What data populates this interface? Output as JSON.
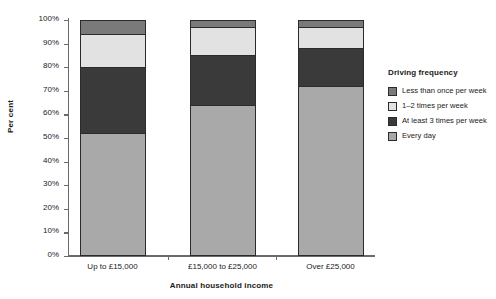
{
  "chart_data": {
    "type": "bar",
    "stacked": true,
    "title": "",
    "xlabel": "Annual household income",
    "ylabel": "Per cent",
    "categories": [
      "Up to £15,000",
      "£15,000 to £25,000",
      "Over £25,000"
    ],
    "ylim": [
      0,
      100
    ],
    "ytick_labels": [
      "0%",
      "10%",
      "20%",
      "30%",
      "40%",
      "50%",
      "60%",
      "70%",
      "80%",
      "90%",
      "100%"
    ],
    "ytick_values": [
      0,
      10,
      20,
      30,
      40,
      50,
      60,
      70,
      80,
      90,
      100
    ],
    "grid": false,
    "legend_position": "right",
    "legend_title": "Driving frequency",
    "series": [
      {
        "name": "Every day",
        "color": "#a9a9a9",
        "values": [
          52,
          64,
          72
        ]
      },
      {
        "name": "At least 3 times per week",
        "color": "#3a3a3a",
        "values": [
          28,
          21,
          16
        ]
      },
      {
        "name": "1–2 times per week",
        "color": "#e2e2e2",
        "values": [
          14,
          12,
          9
        ]
      },
      {
        "name": "Less than once per week",
        "color": "#7a7a7a",
        "values": [
          6,
          3,
          3
        ]
      }
    ]
  },
  "legend": {
    "title": "Driving frequency",
    "items": [
      {
        "label": "Less than once per week",
        "color": "#7a7a7a"
      },
      {
        "label": "1–2 times per week",
        "color": "#e2e2e2"
      },
      {
        "label": "At least 3 times per week",
        "color": "#3a3a3a"
      },
      {
        "label": "Every day",
        "color": "#a9a9a9"
      }
    ]
  },
  "axes": {
    "y_title": "Per cent",
    "x_title": "Annual household income"
  }
}
